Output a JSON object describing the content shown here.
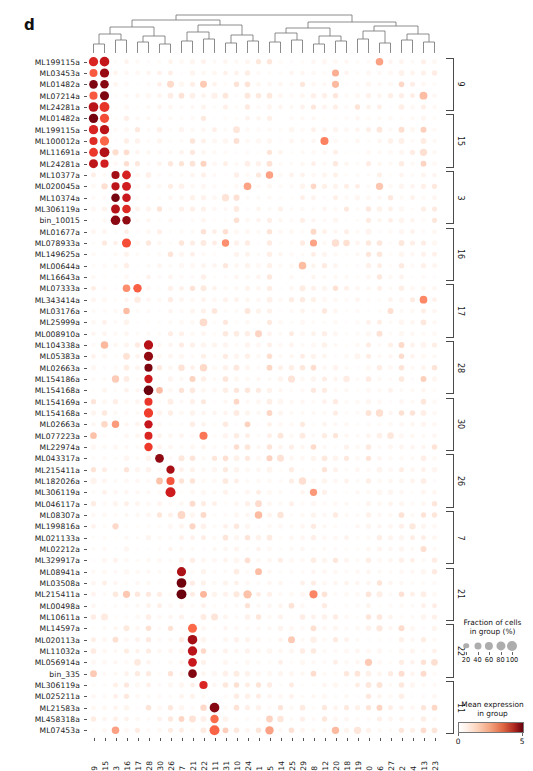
{
  "figure": {
    "panel_letter": "d",
    "type": "dotplot"
  },
  "legend": {
    "fraction": {
      "title_line1": "Fraction of cells",
      "title_line2": "in group (%)",
      "ticks": [
        20,
        40,
        60,
        80,
        100
      ]
    },
    "expression": {
      "title_line1": "Mean expression",
      "title_line2": "in group",
      "ticks": [
        0,
        5
      ],
      "vmin": 0,
      "vmax": 5,
      "colormap_low": "#ffffff",
      "colormap_mid": "#f4a582",
      "colormap_high": "#67000d"
    }
  },
  "chart_data": {
    "type": "heatmap",
    "title": "",
    "xlabel": "",
    "ylabel": "",
    "dot_size_meaning": "Fraction of cells in group (%)",
    "dot_color_meaning": "Mean expression in group",
    "columns": [
      "9",
      "15",
      "3",
      "16",
      "17",
      "28",
      "30",
      "26",
      "7",
      "21",
      "22",
      "11",
      "31",
      "10",
      "24",
      "1",
      "5",
      "14",
      "25",
      "29",
      "8",
      "12",
      "20",
      "18",
      "19",
      "0",
      "6",
      "27",
      "2",
      "4",
      "13",
      "23"
    ],
    "rows": [
      "ML199115a",
      "ML03453a",
      "ML01482a",
      "ML07214a",
      "ML24281a",
      "ML01482a",
      "ML199115a",
      "ML100012a",
      "ML11691a",
      "ML24281a",
      "ML10377a",
      "ML020045a",
      "ML10374a",
      "ML306119a",
      "bin_10015",
      "ML01677a",
      "ML078933a",
      "ML149625a",
      "ML00644a",
      "ML16643a",
      "ML07333a",
      "ML343414a",
      "ML03176a",
      "ML25999a",
      "ML008910a",
      "ML104338a",
      "ML05383a",
      "ML02663a",
      "ML154186a",
      "ML154168a",
      "ML154169a",
      "ML154168a",
      "ML02663a",
      "ML077223a",
      "ML22974a",
      "ML043317a",
      "ML215411a",
      "ML182026a",
      "ML306119a",
      "ML046117a",
      "ML08307a",
      "ML199816a",
      "ML021133a",
      "ML02212a",
      "ML329917a",
      "ML08941a",
      "ML03508a",
      "ML215411a",
      "ML00498a",
      "ML10611a",
      "ML14597a",
      "ML020113a",
      "ML11032a",
      "ML056914a",
      "bin_335",
      "ML306119a",
      "ML025211a",
      "ML21583a",
      "ML458318a",
      "ML07453a"
    ],
    "row_brackets": [
      {
        "label": "9",
        "start": 0,
        "end": 4
      },
      {
        "label": "15",
        "start": 5,
        "end": 9
      },
      {
        "label": "3",
        "start": 10,
        "end": 14
      },
      {
        "label": "16",
        "start": 15,
        "end": 19
      },
      {
        "label": "17",
        "start": 20,
        "end": 24
      },
      {
        "label": "28",
        "start": 25,
        "end": 29
      },
      {
        "label": "30",
        "start": 30,
        "end": 34
      },
      {
        "label": "26",
        "start": 35,
        "end": 39
      },
      {
        "label": "7",
        "start": 40,
        "end": 44
      },
      {
        "label": "21",
        "start": 45,
        "end": 49
      },
      {
        "label": "22",
        "start": 50,
        "end": 54
      },
      {
        "label": "11",
        "start": 55,
        "end": 59
      }
    ],
    "marker_cells": [
      {
        "row": 0,
        "cols": [
          0,
          1
        ]
      },
      {
        "row": 1,
        "cols": [
          0,
          1
        ]
      },
      {
        "row": 2,
        "cols": [
          0,
          1
        ]
      },
      {
        "row": 3,
        "cols": [
          0,
          1
        ]
      },
      {
        "row": 4,
        "cols": [
          0,
          1
        ]
      },
      {
        "row": 5,
        "cols": [
          0,
          1
        ]
      },
      {
        "row": 6,
        "cols": [
          0,
          1
        ]
      },
      {
        "row": 7,
        "cols": [
          0,
          1
        ]
      },
      {
        "row": 8,
        "cols": [
          0,
          1
        ]
      },
      {
        "row": 9,
        "cols": [
          0,
          1
        ]
      },
      {
        "row": 10,
        "cols": [
          2,
          3
        ]
      },
      {
        "row": 11,
        "cols": [
          2,
          3
        ]
      },
      {
        "row": 12,
        "cols": [
          2,
          3
        ]
      },
      {
        "row": 13,
        "cols": [
          2,
          3
        ]
      },
      {
        "row": 14,
        "cols": [
          2,
          3
        ]
      },
      {
        "row": 16,
        "cols": [
          3
        ]
      },
      {
        "row": 20,
        "cols": [
          4
        ]
      },
      {
        "row": 25,
        "cols": [
          5
        ]
      },
      {
        "row": 26,
        "cols": [
          5
        ]
      },
      {
        "row": 27,
        "cols": [
          5
        ]
      },
      {
        "row": 28,
        "cols": [
          5
        ]
      },
      {
        "row": 29,
        "cols": [
          5
        ]
      },
      {
        "row": 30,
        "cols": [
          5
        ]
      },
      {
        "row": 31,
        "cols": [
          5
        ]
      },
      {
        "row": 32,
        "cols": [
          5
        ]
      },
      {
        "row": 33,
        "cols": [
          5
        ]
      },
      {
        "row": 34,
        "cols": [
          5
        ]
      },
      {
        "row": 35,
        "cols": [
          6
        ]
      },
      {
        "row": 36,
        "cols": [
          7
        ]
      },
      {
        "row": 37,
        "cols": [
          7
        ]
      },
      {
        "row": 38,
        "cols": [
          7
        ]
      },
      {
        "row": 45,
        "cols": [
          8
        ]
      },
      {
        "row": 46,
        "cols": [
          8
        ]
      },
      {
        "row": 47,
        "cols": [
          8
        ]
      },
      {
        "row": 50,
        "cols": [
          9
        ]
      },
      {
        "row": 51,
        "cols": [
          9
        ]
      },
      {
        "row": 52,
        "cols": [
          9
        ]
      },
      {
        "row": 53,
        "cols": [
          9
        ]
      },
      {
        "row": 54,
        "cols": [
          9
        ]
      },
      {
        "row": 55,
        "cols": [
          10
        ]
      },
      {
        "row": 57,
        "cols": [
          11
        ]
      },
      {
        "row": 58,
        "cols": [
          11
        ]
      },
      {
        "row": 59,
        "cols": [
          11
        ]
      }
    ],
    "grid": {
      "n_rows": 60,
      "n_cols": 32,
      "gridlines": false
    }
  }
}
